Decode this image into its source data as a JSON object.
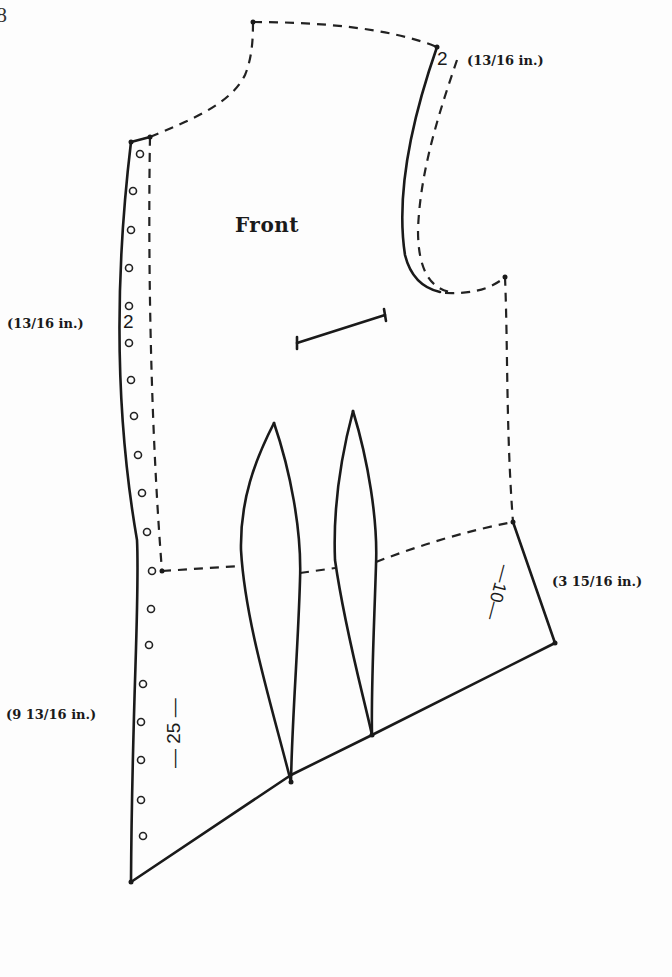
{
  "figure": {
    "number": "8",
    "piece_label": "Front"
  },
  "measurements": {
    "shoulder": {
      "pattern_value": "2",
      "inches": "(13/16 in.)"
    },
    "center_front_upper": {
      "pattern_value": "2",
      "inches": "(13/16 in.)"
    },
    "side_peplum": {
      "pattern_value": "—10—",
      "inches": "(3 15/16 in.)"
    },
    "center_front_lower": {
      "pattern_value": "— 25 —",
      "inches": "(9 13/16 in.)"
    }
  },
  "markings": {
    "button_holes_count": 20,
    "darts_count": 2,
    "pocket_line": "welt pocket placement"
  },
  "colors": {
    "line": "#1a1a1a",
    "background": "#fdfdfd"
  }
}
